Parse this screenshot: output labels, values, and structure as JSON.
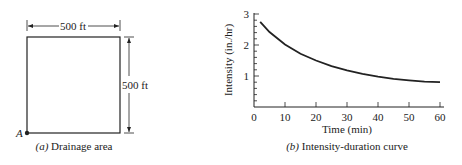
{
  "panel_a": {
    "width_label": "500 ft",
    "height_label": "500 ft",
    "point_label": "A",
    "caption_prefix": "(a)",
    "caption_text": "Drainage area"
  },
  "panel_b": {
    "caption_prefix": "(b)",
    "caption_text": "Intensity-duration curve"
  },
  "chart_data": {
    "type": "line",
    "title": "Intensity-duration curve",
    "xlabel": "Time (min)",
    "ylabel": "Intensity (in./hr)",
    "xlim": [
      0,
      60
    ],
    "ylim": [
      0,
      3
    ],
    "xticks": [
      "0",
      "10",
      "20",
      "30",
      "40",
      "50",
      "60"
    ],
    "yticks": [
      "1",
      "2",
      "3"
    ],
    "grid": false,
    "series": [
      {
        "name": "Intensity",
        "x": [
          2,
          5,
          10,
          15,
          20,
          25,
          30,
          35,
          40,
          45,
          50,
          55,
          60
        ],
        "y": [
          2.75,
          2.42,
          2.02,
          1.72,
          1.5,
          1.32,
          1.18,
          1.07,
          0.98,
          0.91,
          0.86,
          0.82,
          0.8
        ]
      }
    ]
  }
}
